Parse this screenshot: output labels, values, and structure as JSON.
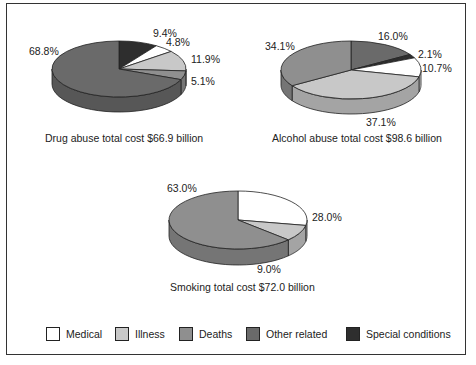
{
  "colors": {
    "Medical": "#ffffff",
    "Illness": "#c8c8c8",
    "Deaths": "#8f8f8f",
    "Other related": "#6a6a6a",
    "Special conditions": "#2e2e2e"
  },
  "legend": [
    {
      "label": "Medical",
      "color": "#ffffff"
    },
    {
      "label": "Illness",
      "color": "#c8c8c8"
    },
    {
      "label": "Deaths",
      "color": "#8f8f8f"
    },
    {
      "label": "Other related",
      "color": "#6a6a6a"
    },
    {
      "label": "Special conditions",
      "color": "#2e2e2e"
    }
  ],
  "chart_data": [
    {
      "type": "pie",
      "title": "Drug abuse total cost $66.9 billion",
      "categories": [
        "Special conditions",
        "Medical",
        "Illness",
        "Deaths",
        "Other related"
      ],
      "values": [
        9.4,
        4.8,
        11.9,
        5.1,
        68.8
      ],
      "labels": [
        "9.4%",
        "4.8%",
        "11.9%",
        "5.1%",
        "68.8%"
      ]
    },
    {
      "type": "pie",
      "title": "Alcohol abuse total cost $98.6 billion",
      "categories": [
        "Other related",
        "Special conditions",
        "Medical",
        "Illness",
        "Deaths"
      ],
      "values": [
        16.0,
        2.1,
        10.7,
        37.1,
        34.1
      ],
      "labels": [
        "16.0%",
        "2.1%",
        "10.7%",
        "37.1%",
        "34.1%"
      ]
    },
    {
      "type": "pie",
      "title": "Smoking total cost $72.0 billion",
      "categories": [
        "Medical",
        "Illness",
        "Deaths"
      ],
      "values": [
        28.0,
        9.0,
        63.0
      ],
      "labels": [
        "28.0%",
        "9.0%",
        "63.0%"
      ]
    }
  ]
}
